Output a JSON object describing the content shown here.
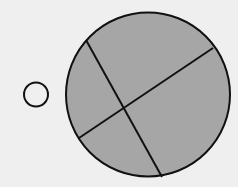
{
  "diagram": {
    "background": "#efefef",
    "small_circle": {
      "cx": 36,
      "cy": 94.5,
      "r": 12,
      "fill": "none",
      "stroke": "#111111",
      "stroke_width": 2
    },
    "large_circle": {
      "cx": 148,
      "cy": 94.5,
      "r": 82,
      "fill": "#a6a6a6",
      "stroke": "#111111",
      "stroke_width": 2
    },
    "chords": [
      {
        "x1": 86,
        "y1": 40,
        "x2": 162,
        "y2": 177,
        "stroke": "#111111",
        "stroke_width": 2
      },
      {
        "x1": 213,
        "y1": 48,
        "x2": 79,
        "y2": 138,
        "stroke": "#111111",
        "stroke_width": 2
      }
    ]
  }
}
